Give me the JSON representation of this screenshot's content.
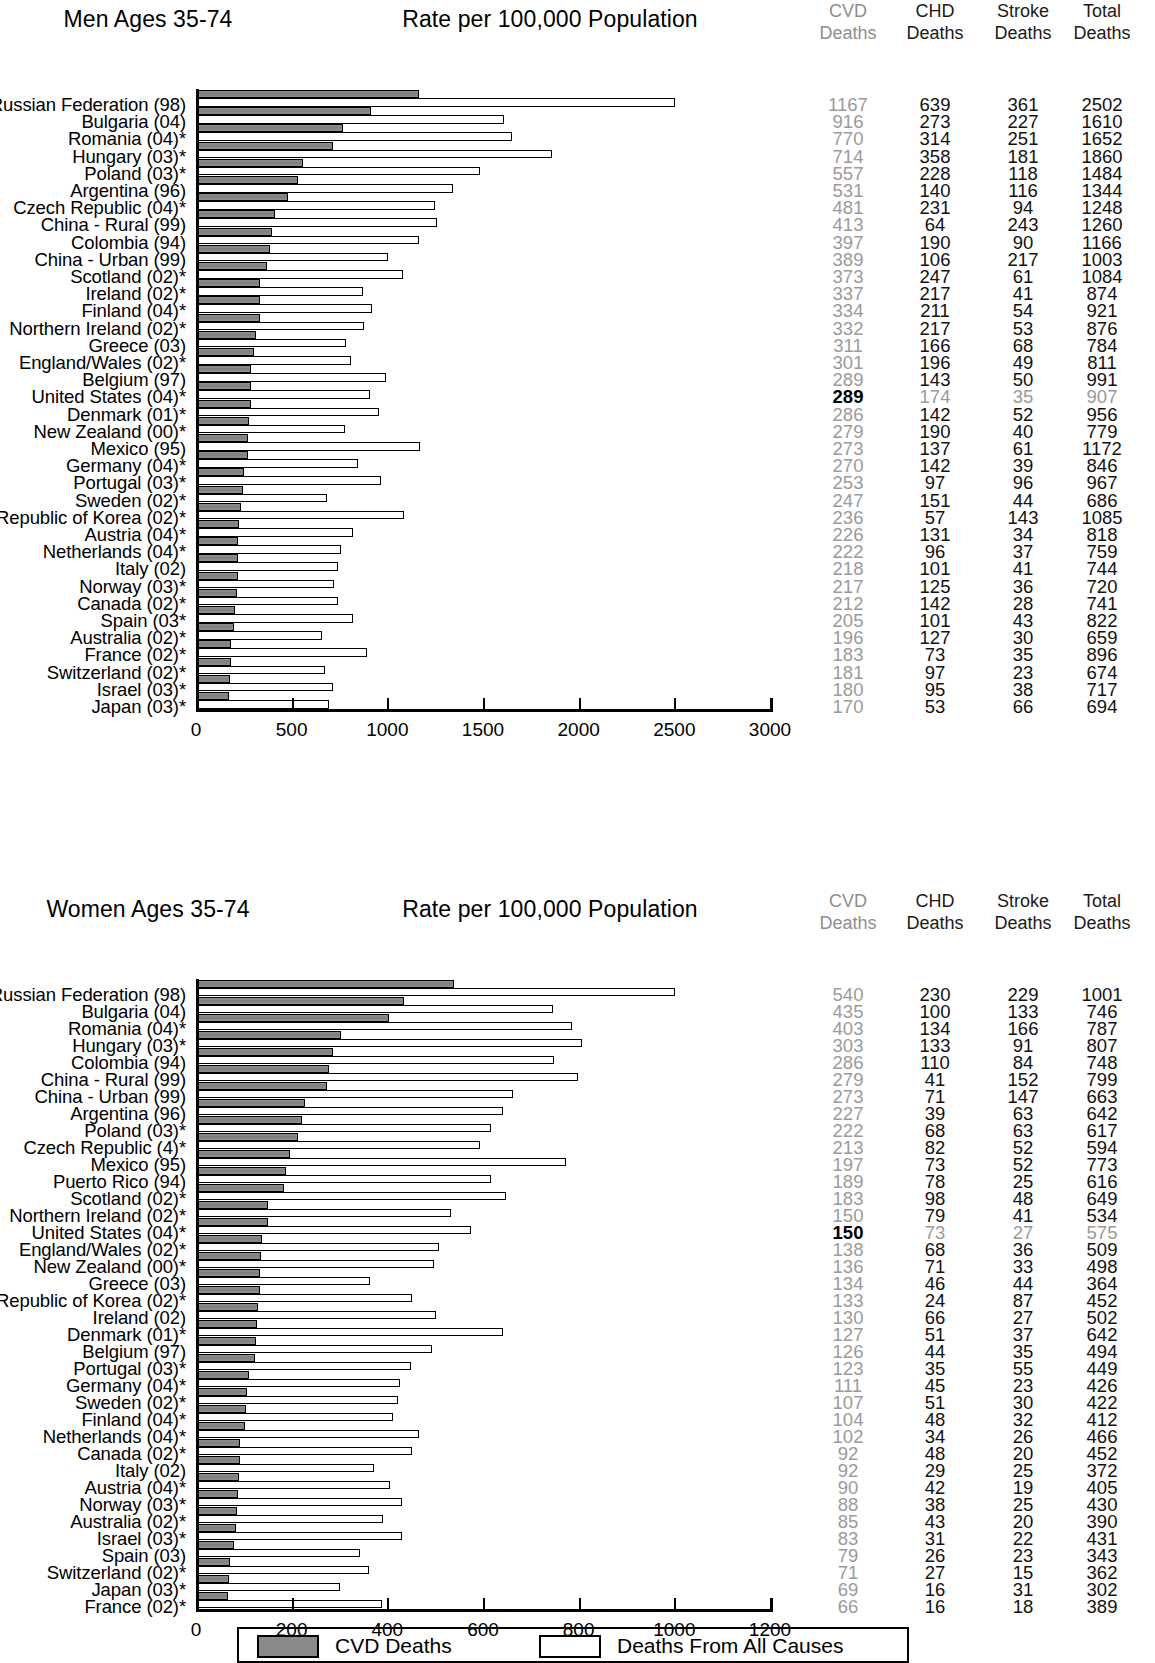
{
  "legend": {
    "cvd_label": "CVD Deaths",
    "all_causes_label": "Deaths From All Causes",
    "cvd_color": "#8a8a8a",
    "all_causes_color": "#ffffff"
  },
  "columns": {
    "cvd": {
      "line1": "CVD",
      "line2": "Deaths"
    },
    "chd": {
      "line1": "CHD",
      "line2": "Deaths"
    },
    "stroke": {
      "line1": "Stroke",
      "line2": "Deaths"
    },
    "total": {
      "line1": "Total",
      "line2": "Deaths"
    }
  },
  "panels": [
    {
      "id": "men",
      "sex_title": "Men Ages 35-74",
      "rate_title": "Rate per 100,000 Population",
      "highlight_row": "United States (04)*",
      "chart_data": {
        "type": "bar",
        "title": "Men Ages 35-74",
        "xlabel": "Rate per 100,000 Population",
        "ylabel": "",
        "xlim": [
          0,
          3000
        ],
        "xticks": [
          0,
          500,
          1000,
          1500,
          2000,
          2500,
          3000
        ],
        "grid": false,
        "legend_position": "bottom",
        "series": [
          {
            "name": "CVD Deaths",
            "color": "#8a8a8a"
          },
          {
            "name": "Deaths From All Causes",
            "color": "#ffffff"
          }
        ],
        "categories": [
          "Russian Federation (98)",
          "Bulgaria (04)",
          "Romania (04)*",
          "Hungary (03)*",
          "Poland (03)*",
          "Argentina (96)",
          "Czech Republic (04)*",
          "China - Rural (99)",
          "Colombia (94)",
          "China - Urban (99)",
          "Scotland (02)*",
          "Ireland (02)*",
          "Finland (04)*",
          "Northern Ireland (02)*",
          "Greece (03)",
          "England/Wales (02)*",
          "Belgium (97)",
          "United States (04)*",
          "Denmark (01)*",
          "New Zealand (00)*",
          "Mexico (95)",
          "Germany (04)*",
          "Portugal (03)*",
          "Sweden (02)*",
          "Republic of Korea (02)*",
          "Austria (04)*",
          "Netherlands (04)*",
          "Italy (02)",
          "Norway (03)*",
          "Canada (02)*",
          "Spain (03*",
          "Australia (02)*",
          "France (02)*",
          "Switzerland (02)*",
          "Israel (03)*",
          "Japan (03)*"
        ],
        "cvd": [
          1167,
          916,
          770,
          714,
          557,
          531,
          481,
          413,
          397,
          389,
          373,
          337,
          334,
          332,
          311,
          301,
          289,
          289,
          286,
          279,
          273,
          270,
          253,
          247,
          236,
          226,
          222,
          218,
          217,
          212,
          205,
          196,
          183,
          181,
          180,
          170
        ],
        "chd": [
          639,
          273,
          314,
          358,
          228,
          140,
          231,
          64,
          190,
          106,
          247,
          217,
          211,
          217,
          166,
          196,
          143,
          174,
          142,
          190,
          137,
          142,
          97,
          151,
          57,
          131,
          96,
          101,
          125,
          142,
          101,
          127,
          73,
          97,
          95,
          53
        ],
        "stroke": [
          361,
          227,
          251,
          181,
          118,
          116,
          94,
          243,
          90,
          217,
          61,
          41,
          54,
          53,
          68,
          49,
          50,
          35,
          52,
          40,
          61,
          39,
          96,
          44,
          143,
          34,
          37,
          41,
          36,
          28,
          43,
          30,
          35,
          23,
          38,
          66
        ],
        "total": [
          2502,
          1610,
          1652,
          1860,
          1484,
          1344,
          1248,
          1260,
          1166,
          1003,
          1084,
          874,
          921,
          876,
          784,
          811,
          991,
          907,
          956,
          779,
          1172,
          846,
          967,
          686,
          1085,
          818,
          759,
          744,
          720,
          741,
          822,
          659,
          896,
          674,
          717,
          694
        ]
      }
    },
    {
      "id": "women",
      "sex_title": "Women Ages 35-74",
      "rate_title": "Rate per 100,000 Population",
      "highlight_row": "United States (04)*",
      "chart_data": {
        "type": "bar",
        "title": "Women Ages 35-74",
        "xlabel": "Rate per 100,000 Population",
        "ylabel": "",
        "xlim": [
          0,
          1200
        ],
        "xticks": [
          0,
          200,
          400,
          600,
          800,
          1000,
          1200
        ],
        "grid": false,
        "legend_position": "bottom",
        "series": [
          {
            "name": "CVD Deaths",
            "color": "#8a8a8a"
          },
          {
            "name": "Deaths From All Causes",
            "color": "#ffffff"
          }
        ],
        "categories": [
          "Russian Federation (98)",
          "Bulgaria (04)",
          "Romania (04)*",
          "Hungary (03)*",
          "Colombia (94)",
          "China - Rural (99)",
          "China - Urban (99)",
          "Argentina (96)",
          "Poland (03)*",
          "Czech Republic (4)*",
          "Mexico (95)",
          "Puerto Rico (94)",
          "Scotland (02)*",
          "Northern Ireland (02)*",
          "United States (04)*",
          "England/Wales (02)*",
          "New Zealand (00)*",
          "Greece (03)",
          "Republic of Korea (02)*",
          "Ireland (02)",
          "Denmark (01)*",
          "Belgium (97)",
          "Portugal (03)*",
          "Germany (04)*",
          "Sweden (02)*",
          "Finland (04)*",
          "Netherlands (04)*",
          "Canada (02)*",
          "Italy (02)",
          "Austria (04)*",
          "Norway (03)*",
          "Australia (02)*",
          "Israel (03)*",
          "Spain (03)",
          "Switzerland (02)*",
          "Japan (03)*",
          "France (02)*"
        ],
        "cvd": [
          540,
          435,
          403,
          303,
          286,
          279,
          273,
          227,
          222,
          213,
          197,
          189,
          183,
          150,
          150,
          138,
          136,
          134,
          133,
          130,
          127,
          126,
          123,
          111,
          107,
          104,
          102,
          92,
          92,
          90,
          88,
          85,
          83,
          79,
          71,
          69,
          66
        ],
        "chd": [
          230,
          100,
          134,
          133,
          110,
          41,
          71,
          39,
          68,
          82,
          73,
          78,
          98,
          79,
          73,
          68,
          71,
          46,
          24,
          66,
          51,
          44,
          35,
          45,
          51,
          48,
          34,
          48,
          29,
          42,
          38,
          43,
          31,
          26,
          27,
          16,
          16
        ],
        "stroke": [
          229,
          133,
          166,
          91,
          84,
          152,
          147,
          63,
          63,
          52,
          52,
          25,
          48,
          41,
          27,
          36,
          33,
          44,
          87,
          27,
          37,
          35,
          55,
          23,
          30,
          32,
          26,
          20,
          25,
          19,
          25,
          20,
          22,
          23,
          15,
          31,
          18
        ],
        "total": [
          1001,
          746,
          787,
          807,
          748,
          799,
          663,
          642,
          617,
          594,
          773,
          616,
          649,
          534,
          575,
          509,
          498,
          364,
          452,
          502,
          642,
          494,
          449,
          426,
          422,
          412,
          466,
          452,
          372,
          405,
          430,
          390,
          431,
          343,
          362,
          302,
          389
        ]
      }
    }
  ]
}
